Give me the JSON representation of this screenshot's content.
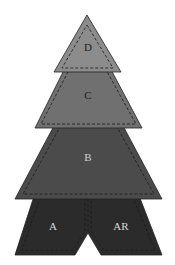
{
  "diagram": {
    "title": "",
    "pieces": [
      {
        "id": "A",
        "label": "A",
        "color": "#2b2b2b",
        "label_color": "#d8d8d8"
      },
      {
        "id": "AR",
        "label": "AR",
        "color": "#2b2b2b",
        "label_color": "#d8d8d8"
      },
      {
        "id": "B",
        "label": "B",
        "color": "#4b4b4b",
        "label_color": "#d0d0d0"
      },
      {
        "id": "C",
        "label": "C",
        "color": "#707070",
        "label_color": "#1e1e1e"
      },
      {
        "id": "D",
        "label": "D",
        "color": "#8c8c8c",
        "label_color": "#1e1e1e"
      }
    ],
    "layout_description": "Christmas tree quilt pattern: stacked pieces D (top triangle), C, B (trapezoids), and A/AR (bottom trunk pieces split by a center notch), each with dashed seam allowance lines"
  }
}
